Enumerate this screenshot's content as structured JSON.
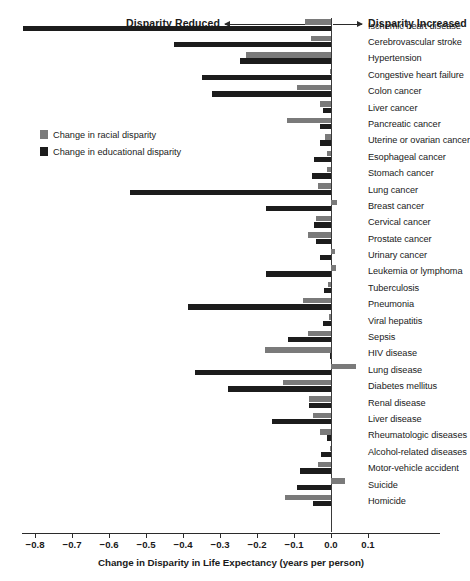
{
  "header": {
    "left_direction_label": "Disparity Reduced",
    "right_direction_label": "Disparity Increased",
    "left_arrow_icon": "arrow-left-icon",
    "right_arrow_icon": "arrow-right-icon"
  },
  "legend": {
    "position": "upper-left-inside-plot",
    "items": [
      {
        "label": "Change in racial disparity",
        "color": "#7a7a7a"
      },
      {
        "label": "Change in educational disparity",
        "color": "#1c1c1c"
      }
    ]
  },
  "axis": {
    "title": "Change in Disparity in Life Expectancy (years per person)",
    "tick_labels": [
      "−0.8",
      "−0.7",
      "−0.6",
      "−0.5",
      "−0.4",
      "−0.3",
      "−0.2",
      "−0.1",
      "0.0",
      "0.1"
    ],
    "tick_values": [
      -0.8,
      -0.7,
      -0.6,
      -0.5,
      -0.4,
      -0.3,
      -0.2,
      -0.1,
      0.0,
      0.1
    ]
  },
  "chart_data": {
    "type": "bar",
    "orientation": "horizontal",
    "title": "",
    "xlabel": "Change in Disparity in Life Expectancy (years per person)",
    "ylabel": "",
    "xlim": [
      -0.85,
      0.15
    ],
    "grid": false,
    "legend_position": "upper-left",
    "annotations": [
      "Disparity Reduced",
      "Disparity Increased"
    ],
    "categories": [
      "Ischemic heart disease",
      "Cerebrovascular stroke",
      "Hypertension",
      "Congestive heart failure",
      "Colon cancer",
      "Liver cancer",
      "Pancreatic cancer",
      "Uterine or ovarian cancer",
      "Esophageal cancer",
      "Stomach cancer",
      "Lung cancer",
      "Breast cancer",
      "Cervical cancer",
      "Prostate cancer",
      "Urinary cancer",
      "Leukemia or lymphoma",
      "Tuberculosis",
      "Pneumonia",
      "Viral hepatitis",
      "Sepsis",
      "HIV disease",
      "Lung disease",
      "Diabetes mellitus",
      "Renal disease",
      "Liver disease",
      "Rheumatologic diseases",
      "Alcohol-related diseases",
      "Motor-vehicle accident",
      "Suicide",
      "Homicide"
    ],
    "series": [
      {
        "name": "Change in racial disparity",
        "color": "#7a7a7a",
        "values": [
          -0.07,
          -0.054,
          -0.23,
          -0.003,
          -0.092,
          -0.03,
          -0.119,
          -0.015,
          -0.012,
          -0.012,
          -0.035,
          0.016,
          -0.04,
          -0.062,
          0.012,
          0.014,
          -0.008,
          -0.076,
          -0.006,
          -0.062,
          -0.178,
          0.068,
          -0.13,
          -0.06,
          -0.049,
          -0.03,
          -0.002,
          -0.035,
          0.038,
          -0.125
        ]
      },
      {
        "name": "Change in educational disparity",
        "color": "#1c1c1c",
        "values": [
          -0.832,
          -0.424,
          -0.246,
          -0.35,
          -0.322,
          -0.022,
          -0.03,
          -0.03,
          -0.046,
          -0.052,
          -0.543,
          -0.175,
          -0.046,
          -0.041,
          -0.03,
          -0.176,
          -0.02,
          -0.387,
          -0.022,
          -0.117,
          -0.002,
          -0.368,
          -0.279,
          -0.06,
          -0.16,
          -0.011,
          -0.028,
          -0.084,
          -0.092,
          -0.049
        ]
      }
    ]
  }
}
